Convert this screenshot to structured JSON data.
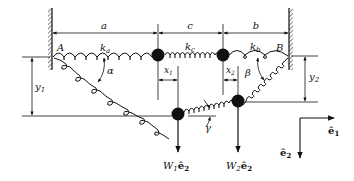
{
  "diagram": {
    "walls": {
      "left_label": "A",
      "right_label": "B"
    },
    "dimensions": {
      "a": "a",
      "c": "c",
      "b": "b",
      "x1": "x",
      "x1_sub": "1",
      "x2": "x",
      "x2_sub": "2",
      "y1": "y",
      "y1_sub": "1",
      "y2": "y",
      "y2_sub": "2"
    },
    "springs": {
      "ka": "k",
      "ka_sub": "a",
      "kc": "k",
      "kc_sub": "c",
      "kb": "k",
      "kb_sub": "b"
    },
    "angles": {
      "alpha": "α",
      "beta": "β",
      "gamma": "γ"
    },
    "loads": {
      "w1": "W",
      "w1_sub": "1",
      "w1_vec": "ê",
      "w1_vec_sub": "2",
      "w2": "W",
      "w2_sub": "2",
      "w2_vec": "ê",
      "w2_vec_sub": "2"
    },
    "axes": {
      "e1": "ê",
      "e1_sub": "1",
      "e2": "ê",
      "e2_sub": "2"
    },
    "colors": {
      "ink": "#111111",
      "background": "#ffffff"
    }
  }
}
